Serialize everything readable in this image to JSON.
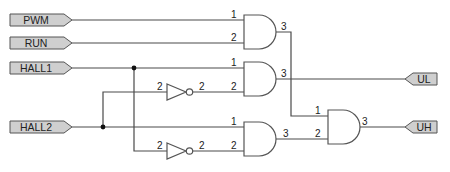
{
  "diagram": {
    "type": "logic-schematic",
    "inputs": [
      {
        "id": "pwm",
        "label": "PWM"
      },
      {
        "id": "run",
        "label": "RUN"
      },
      {
        "id": "hall1",
        "label": "HALL1"
      },
      {
        "id": "hall2",
        "label": "HALL2"
      }
    ],
    "outputs": [
      {
        "id": "ul",
        "label": "UL"
      },
      {
        "id": "uh",
        "label": "UH"
      }
    ],
    "pins": {
      "g1_in1": "1",
      "g1_in2": "2",
      "g1_out": "3",
      "g2_in1": "1",
      "g2_in2": "2",
      "g2_out": "3",
      "g3_in1": "1",
      "g3_in2": "2",
      "g3_out": "3",
      "g4_in1": "1",
      "g4_in2": "2",
      "g4_out": "3",
      "inv1_in": "2",
      "inv1_out": "2",
      "inv2_in": "2",
      "inv2_out": "2"
    },
    "gates": [
      {
        "id": "and1",
        "type": "AND",
        "inputs": [
          "PWM",
          "RUN"
        ]
      },
      {
        "id": "and2",
        "type": "AND",
        "inputs": [
          "HALL1",
          "NOT HALL2"
        ],
        "output": "UL"
      },
      {
        "id": "and3",
        "type": "AND",
        "inputs": [
          "HALL2",
          "NOT HALL1"
        ]
      },
      {
        "id": "and4",
        "type": "AND",
        "inputs": [
          "and1",
          "and3"
        ],
        "output": "UH"
      },
      {
        "id": "inv1",
        "type": "NOT",
        "input": "HALL2"
      },
      {
        "id": "inv2",
        "type": "NOT",
        "input": "HALL1"
      }
    ]
  }
}
